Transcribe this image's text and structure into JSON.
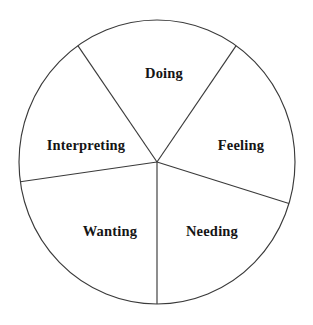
{
  "chart_data": {
    "type": "pie",
    "title": "",
    "subtitle": "",
    "xlabel": "",
    "ylabel": "",
    "legend": "none",
    "grid": false,
    "labels_position": "inside-slice",
    "center": {
      "x": 157,
      "y": 162
    },
    "radius_x": 138,
    "radius_y": 142,
    "stroke_color": "#3a3a3a",
    "fill_color": "#ffffff",
    "label_color": "#151515",
    "categories": [
      "Doing",
      "Feeling",
      "Needing",
      "Wanting",
      "Interpreting"
    ],
    "values": [
      70,
      72,
      73,
      72,
      73
    ],
    "units": "degrees",
    "slices": [
      {
        "label": "Doing",
        "value": 70,
        "start_angle": 55,
        "end_angle": 125,
        "label_x": 164,
        "label_y": 73
      },
      {
        "label": "Feeling",
        "value": 72,
        "start_angle": -17,
        "end_angle": 55,
        "label_x": 241,
        "label_y": 145
      },
      {
        "label": "Needing",
        "value": 73,
        "start_angle": -90,
        "end_angle": -17,
        "label_x": 212,
        "label_y": 231
      },
      {
        "label": "Wanting",
        "value": 72,
        "start_angle": -172,
        "end_angle": -90,
        "label_x": 110,
        "label_y": 231
      },
      {
        "label": "Interpreting",
        "value": 73,
        "start_angle": 125,
        "end_angle": 188,
        "label_x": 86,
        "label_y": 145
      }
    ]
  }
}
